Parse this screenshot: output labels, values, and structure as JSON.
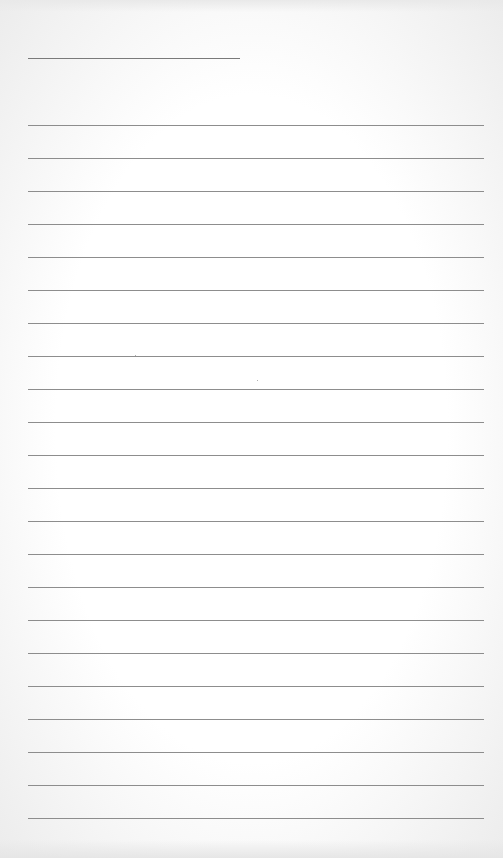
{
  "page": {
    "type": "lined-paper",
    "background_color": "#ffffff",
    "line_color": "#8d8d8d",
    "header_line": {
      "x": 28,
      "y": 58,
      "width": 212
    },
    "rules": {
      "count": 22,
      "first_y": 125,
      "spacing": 33,
      "x": 28,
      "width": 456
    }
  }
}
